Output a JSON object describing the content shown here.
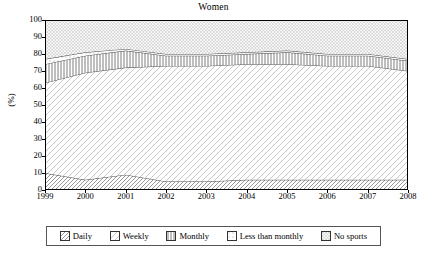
{
  "chart_data": {
    "type": "area",
    "title": "Women",
    "xlabel": "",
    "ylabel": "(%)",
    "ylim": [
      0,
      100
    ],
    "ytick_values": [
      0,
      10,
      20,
      30,
      40,
      50,
      60,
      70,
      80,
      90,
      100
    ],
    "categories": [
      "1999",
      "2000",
      "2001",
      "2002",
      "2003",
      "2004",
      "2005",
      "2006",
      "2007",
      "2008"
    ],
    "x": [
      1999,
      2000,
      2001,
      2002,
      2003,
      2004,
      2005,
      2006,
      2007,
      2008
    ],
    "stacked": true,
    "grid": false,
    "legend_position": "below",
    "series": [
      {
        "name": "Daily",
        "pattern": "diagonal-hatch",
        "values": [
          10,
          6,
          9,
          5,
          5,
          6,
          6,
          6,
          6,
          6
        ]
      },
      {
        "name": "Weekly",
        "pattern": "light-diagonal-hatch",
        "values": [
          53,
          63,
          63,
          68,
          68,
          68,
          68,
          67,
          67,
          64
        ]
      },
      {
        "name": "Monthly",
        "pattern": "vertical-lines",
        "values": [
          11,
          10,
          10,
          6,
          6,
          6,
          7,
          6,
          6,
          6
        ]
      },
      {
        "name": "Less than monthly",
        "pattern": "fine-dots",
        "values": [
          3,
          2,
          1,
          1,
          1,
          1,
          1,
          1,
          1,
          1
        ]
      },
      {
        "name": "No sports",
        "pattern": "dense-dots",
        "values": [
          23,
          19,
          17,
          20,
          20,
          19,
          18,
          20,
          20,
          23
        ]
      }
    ],
    "cumulative_boundaries": {
      "daily_top": [
        10,
        6,
        9,
        5,
        5,
        6,
        6,
        6,
        6,
        6
      ],
      "weekly_top": [
        63,
        69,
        72,
        73,
        73,
        74,
        74,
        73,
        73,
        70
      ],
      "monthly_top": [
        74,
        79,
        82,
        79,
        79,
        80,
        81,
        79,
        79,
        76
      ],
      "less_than_monthly_top": [
        77,
        81,
        83,
        80,
        80,
        81,
        82,
        80,
        80,
        77
      ],
      "no_sports_top": [
        100,
        100,
        100,
        100,
        100,
        100,
        100,
        100,
        100,
        100
      ]
    }
  },
  "legend": {
    "items": [
      {
        "label": "Daily"
      },
      {
        "label": "Weekly"
      },
      {
        "label": "Monthly"
      },
      {
        "label": "Less than monthly"
      },
      {
        "label": "No sports"
      }
    ]
  },
  "colors": {
    "axis": "#000000",
    "line": "#3a3a3a",
    "fill_light": "#f4f4f4",
    "fill_mid": "#e2e2e2",
    "legend_border": "#555555"
  }
}
